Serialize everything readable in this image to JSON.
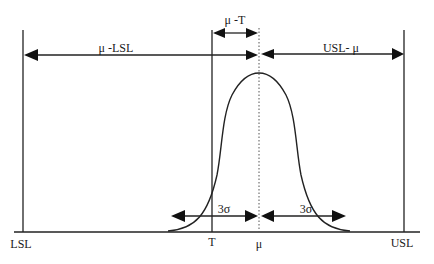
{
  "diagram": {
    "axis_labels": {
      "lsl": "LSL",
      "target": "T",
      "mean": "μ",
      "usl": "USL"
    },
    "dimension_labels": {
      "mean_minus_lsl": "μ -LSL",
      "usl_minus_mean": "USL- μ",
      "mean_minus_target": "μ -T",
      "three_sigma_left": "3σ",
      "three_sigma_right": "3σ"
    },
    "colors": {
      "line": "#222222",
      "background": "#ffffff"
    }
  }
}
